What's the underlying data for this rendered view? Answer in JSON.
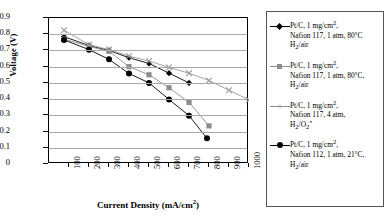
{
  "chart_data": {
    "type": "line",
    "title": "",
    "xlabel": "Current Density (mA/cm2)",
    "xlabel_base": "Current Density (mA/cm",
    "xlabel_sup": "2",
    "xlabel_tail": ")",
    "ylabel": "Voltage (V)",
    "xlim": [
      0,
      1000
    ],
    "ylim": [
      0,
      0.9
    ],
    "xticks": [
      100,
      200,
      300,
      400,
      500,
      600,
      700,
      800,
      900,
      1000
    ],
    "yticks": [
      "0.9",
      "0.8",
      "0.7",
      "0.6",
      "0.5",
      "0.4",
      "0.3",
      "0.2",
      "0.1",
      "0"
    ],
    "ytick_values": [
      0.9,
      0.8,
      0.7,
      0.6,
      0.5,
      0.4,
      0.3,
      0.2,
      0.1,
      0
    ],
    "grid": "horizontal",
    "legend_position": "right",
    "series": [
      {
        "name": "Pt/C, 1 mg/cm2, Nafion 117, 1 atm, 80C H2/air",
        "marker": "diamond",
        "color": "#000000",
        "x": [
          75,
          200,
          300,
          400,
          500,
          600,
          700
        ],
        "y": [
          0.785,
          0.73,
          0.7,
          0.655,
          0.62,
          0.56,
          0.5
        ]
      },
      {
        "name": "Pt/C, 1 mg/cm2, Nafion 117, 1 atm, 80C, H2/air",
        "marker": "square",
        "color": "#8c8c8c",
        "x": [
          75,
          200,
          300,
          400,
          500,
          600,
          700,
          800
        ],
        "y": [
          0.77,
          0.725,
          0.695,
          0.6,
          0.55,
          0.47,
          0.38,
          0.235
        ]
      },
      {
        "name": "Pt/C, 1 mg/cm2, Nafion 117, 4 atm, H2/O2",
        "marker": "x",
        "color": "#9a9a9a",
        "x": [
          75,
          200,
          300,
          400,
          500,
          600,
          700,
          800,
          900,
          1000
        ],
        "y": [
          0.825,
          0.735,
          0.705,
          0.665,
          0.635,
          0.595,
          0.56,
          0.515,
          0.455,
          0.395
        ]
      },
      {
        "name": "Pt/C, 1 mg/cm2, Nafion 112, 1 atm, 21C, H2/air",
        "marker": "circle",
        "color": "#000000",
        "x": [
          75,
          200,
          300,
          400,
          500,
          600,
          700,
          790
        ],
        "y": [
          0.765,
          0.705,
          0.645,
          0.558,
          0.5,
          0.398,
          0.298,
          0.158
        ]
      }
    ]
  },
  "legend": {
    "items": [
      {
        "marker": "diamond",
        "line1_a": "Pt/C, 1 mg/cm",
        "line1_sup": "2",
        "line1_b": ",",
        "line2": "Nafion 117, 1 atm, 80°C",
        "line3_a": "H",
        "line3_sub": "2",
        "line3_b": "/air"
      },
      {
        "marker": "square",
        "line1_a": "Pt/C, 1 mg/cm",
        "line1_sup": "2",
        "line1_b": ",",
        "line2": "Nafion 117, 1 atm, 80°C,",
        "line3_a": "H",
        "line3_sub": "2",
        "line3_b": "/air"
      },
      {
        "marker": "x",
        "line1_a": "Pt/C, 1 mg/cm",
        "line1_sup": "2",
        "line1_b": ",",
        "line2": "Nafion 117, 4 atm,",
        "line3_a": "H",
        "line3_sub": "2",
        "line3_b": "/O",
        "line3_sub2": "2",
        "line3_c": "\""
      },
      {
        "marker": "circle",
        "line1_a": "Pt/C, 1 mg/cm",
        "line1_sup": "2",
        "line1_b": ",",
        "line2": "Nafion 112, 1 atm, 21°C,",
        "line3_a": "H",
        "line3_sub": "2",
        "line3_b": "/air"
      }
    ]
  }
}
